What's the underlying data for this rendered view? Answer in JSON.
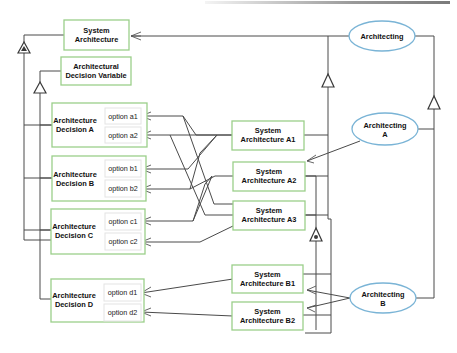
{
  "diagram": {
    "nodes": {
      "system_architecture": {
        "line1": "System",
        "line2": "Architecture"
      },
      "decision_variable": {
        "line1": "Architectural",
        "line2": "Decision Variable"
      },
      "decision_a": {
        "line1": "Architecture",
        "line2": "Decision A",
        "options": [
          "option a1",
          "option a2"
        ]
      },
      "decision_b": {
        "line1": "Architecture",
        "line2": "Decision B",
        "options": [
          "option b1",
          "option b2"
        ]
      },
      "decision_c": {
        "line1": "Architecture",
        "line2": "Decision C",
        "options": [
          "option c1",
          "option c2"
        ]
      },
      "decision_d": {
        "line1": "Architecture",
        "line2": "Decision D",
        "options": [
          "option d1",
          "option d2"
        ]
      },
      "sys_a1": {
        "line1": "System",
        "line2": "Architecture A1"
      },
      "sys_a2": {
        "line1": "System",
        "line2": "Architecture A2"
      },
      "sys_a3": {
        "line1": "System",
        "line2": "Architecture A3"
      },
      "sys_b1": {
        "line1": "System",
        "line2": "Architecture B1"
      },
      "sys_b2": {
        "line1": "System",
        "line2": "Architecture B2"
      },
      "architecting": {
        "line1": "Architecting"
      },
      "architecting_a": {
        "line1": "Architecting",
        "line2": "A"
      },
      "architecting_b": {
        "line1": "Architecting",
        "line2": "B"
      }
    },
    "colors": {
      "box_border": "#9bcf8a",
      "ellipse_border": "#7ab4d6",
      "line": "#4a4a4a"
    }
  }
}
